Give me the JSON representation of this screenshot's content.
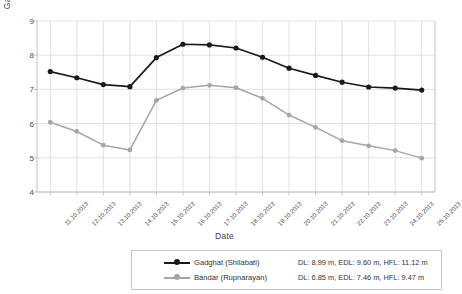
{
  "chart_data": {
    "type": "line",
    "title": "",
    "xlabel": "Date",
    "ylabel": "Gauge Level (m)",
    "ylim": [
      4,
      9
    ],
    "yticks": [
      4,
      5,
      6,
      7,
      8,
      9
    ],
    "grid": true,
    "legend_position": "bottom",
    "categories": [
      "11.10.2013",
      "12.10.2013",
      "13.10.2013",
      "14.10.2013",
      "15.10.2013",
      "16.10.2013",
      "17.10.2013",
      "18.10.2013",
      "19.10.2013",
      "20.10.2013",
      "21.10.2013",
      "22.10.2013",
      "23.10.2013",
      "24.10.2013",
      "25.10.2013"
    ],
    "series": [
      {
        "name": "Gadghat (Shilabati)",
        "color": "#1a1a1a",
        "marker": "circle",
        "values": [
          7.52,
          7.34,
          7.14,
          7.08,
          7.93,
          8.32,
          8.3,
          8.21,
          7.94,
          7.62,
          7.41,
          7.21,
          7.07,
          7.04,
          6.98
        ]
      },
      {
        "name": "Bandar (Rupnarayan)",
        "color": "#a6a6a6",
        "marker": "circle",
        "values": [
          6.04,
          5.77,
          5.37,
          5.23,
          6.68,
          7.04,
          7.12,
          7.05,
          6.74,
          6.25,
          5.89,
          5.5,
          5.35,
          5.21,
          4.99
        ]
      }
    ]
  },
  "legend": {
    "rows": [
      {
        "name": "Gadghat (Shilabati)",
        "stats": "DL: 8.99 m, EDL: 9.60 m, HFL: 11.12 m"
      },
      {
        "name": "Bandar (Rupnarayan)",
        "stats": "DL: 6.85 m, EDL: 7.46 m, HFL: 9.47 m"
      }
    ]
  },
  "colors": {
    "series_primary": "#1a1a1a",
    "series_secondary": "#a6a6a6",
    "grid": "#d9d9d9",
    "axis": "#bfbfbf",
    "text": "#3a3a3a",
    "legend_border": "#c8c8c8",
    "background": "#ffffff"
  }
}
